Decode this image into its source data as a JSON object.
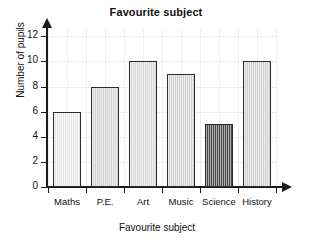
{
  "chart_data": {
    "type": "bar",
    "title": "Favourite subject",
    "xlabel": "Favourite subject",
    "ylabel": "Number of pupils",
    "categories": [
      "Maths",
      "P.E.",
      "Art",
      "Music",
      "Science",
      "History"
    ],
    "values": [
      6,
      8,
      10,
      9,
      5,
      10
    ],
    "ylim": [
      0,
      12
    ],
    "yticks": [
      0,
      2,
      4,
      6,
      8,
      10,
      12
    ],
    "ytick_labels": [
      "0",
      "2",
      "4",
      "6",
      "8",
      "10",
      "12"
    ],
    "grid": true,
    "legend": null,
    "bar_colors": [
      "#f2f2f2",
      "#dcdcdc",
      "#e2e2e2",
      "#dadada",
      "#4a4a4a",
      "#d9d9d9"
    ],
    "bar_edge_color": "#2b2b2b",
    "highlight_category": "Science",
    "axis_color": "#1b1b1b",
    "grid_color": "#ededf2",
    "background": "#ffffff"
  }
}
